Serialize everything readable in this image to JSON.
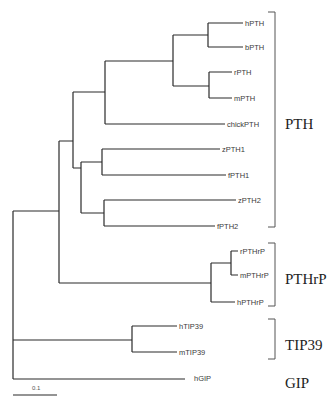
{
  "figure": {
    "type": "phylogenetic-tree",
    "leaves": [
      {
        "id": "hPTH",
        "label": "hPTH",
        "y": 23,
        "x_end": 243
      },
      {
        "id": "bPTH",
        "label": "bPTH",
        "y": 47,
        "x_end": 243
      },
      {
        "id": "rPTH",
        "label": "rPTH",
        "y": 72,
        "x_end": 232
      },
      {
        "id": "mPTH",
        "label": "mPTH",
        "y": 98,
        "x_end": 232
      },
      {
        "id": "chickPTH",
        "label": "chickPTH",
        "y": 124,
        "x_end": 225
      },
      {
        "id": "zPTH1",
        "label": "zPTH1",
        "y": 149,
        "x_end": 220
      },
      {
        "id": "fPTH1",
        "label": "fPTH1",
        "y": 175,
        "x_end": 226
      },
      {
        "id": "zPTH2",
        "label": "zPTH2",
        "y": 200,
        "x_end": 236
      },
      {
        "id": "fPTH2",
        "label": "fPTH2",
        "y": 226,
        "x_end": 215
      },
      {
        "id": "rPTHrP",
        "label": "rPTHrP",
        "y": 251,
        "x_end": 238
      },
      {
        "id": "mPTHrP",
        "label": "mPTHrP",
        "y": 275,
        "x_end": 238
      },
      {
        "id": "hPTHrP",
        "label": "hPTHrP",
        "y": 302,
        "x_end": 235
      },
      {
        "id": "hTIP39",
        "label": "hTIP39",
        "y": 326,
        "x_end": 177
      },
      {
        "id": "mTIP39",
        "label": "mTIP39",
        "y": 352,
        "x_end": 177
      },
      {
        "id": "hGIP",
        "label": "hGIP",
        "y": 378,
        "x_end": 185
      }
    ],
    "groups": [
      {
        "id": "PTH",
        "label": "PTH",
        "bracket_top": 12,
        "bracket_bottom": 97,
        "bracket_bottom_full": 227,
        "label_y": 129
      },
      {
        "id": "PTHrP",
        "label": "PTHrP",
        "bracket_top": 243,
        "bracket_bottom": 306,
        "label_y": 279
      },
      {
        "id": "TIP39",
        "label": "TIP39",
        "bracket_top": 319,
        "bracket_bottom": 359,
        "label_y": 345
      },
      {
        "id": "GIP",
        "label": "GIP",
        "label_y": 383
      }
    ],
    "scale_bar": {
      "label": "0.1",
      "x1": 13,
      "x2": 57,
      "y": 393
    }
  }
}
